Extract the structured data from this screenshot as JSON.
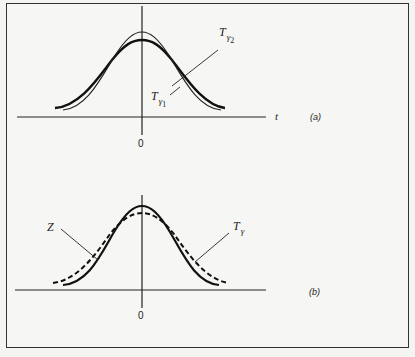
{
  "figure": {
    "panel_a": {
      "tag": "(a)",
      "x_axis_label": "t",
      "origin_label": "0",
      "curves": [
        {
          "name": "T_gamma1",
          "label_main": "T",
          "label_sub": "γ",
          "label_subsub": "1",
          "style": "thin solid",
          "peak": "higher, narrower"
        },
        {
          "name": "T_gamma2",
          "label_main": "T",
          "label_sub": "γ",
          "label_subsub": "2",
          "style": "thick solid",
          "peak": "lower, wider"
        }
      ]
    },
    "panel_b": {
      "tag": "(b)",
      "origin_label": "0",
      "curves": [
        {
          "name": "Z",
          "label_main": "Z",
          "style": "thick solid",
          "peak": "higher, narrower"
        },
        {
          "name": "T_gamma",
          "label_main": "T",
          "label_sub": "γ",
          "style": "thick dashed",
          "peak": "lower, wider"
        }
      ]
    }
  }
}
